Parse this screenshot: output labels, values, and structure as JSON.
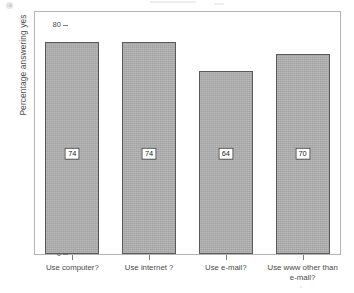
{
  "chart_data": {
    "type": "bar",
    "title": "",
    "subtitle": "",
    "xlabel": "",
    "ylabel": "Percentage answering yes",
    "categories": [
      "Use computer?",
      "Use internet ?",
      "Use e-mail?",
      "Use www other than\ne-mail?"
    ],
    "values": [
      74,
      74,
      64,
      70
    ],
    "value_labels": [
      "74",
      "74",
      "64",
      "70"
    ],
    "ylim": [
      0,
      85
    ],
    "yticks": [
      0,
      20,
      40,
      60,
      80
    ],
    "ytick_labels": [
      "0",
      "20",
      "40",
      "60",
      "80"
    ],
    "grid": false,
    "legend": null,
    "bar_color": "#a9a9a9",
    "bar_edge_color": "#595959",
    "axis_color": "#7d7d7d",
    "frame_color": "#b4b4b4",
    "text_color": "#4a4a4a",
    "value_label_y": 35
  }
}
